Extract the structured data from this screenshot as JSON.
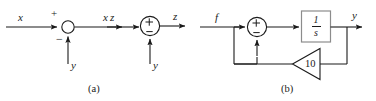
{
  "figure": {
    "captions": [
      {
        "id": "a",
        "text": "(a)"
      },
      {
        "id": "b",
        "text": "(b)"
      }
    ],
    "colors": {
      "line": "#1a1a1a",
      "block_border": "#8c8c8c",
      "background": "#ffffff",
      "text": "#1a1a1a"
    }
  },
  "diagram_a": {
    "variant_1": {
      "input_label": "x",
      "output_label": "z",
      "feedback_input_label": "y",
      "sign_top": "+",
      "sign_bottom": "−",
      "junction_style": "open-circle"
    },
    "variant_2": {
      "input_label": "x",
      "output_label": "z",
      "feedback_input_label": "y",
      "sign_top": "+",
      "sign_bottom": "−",
      "junction_style": "circle-with-internal-signs"
    }
  },
  "diagram_b": {
    "input_label": "f",
    "output_label": "y",
    "sign_top": "+",
    "sign_bottom": "−",
    "integrator_block": {
      "numerator": "1",
      "denominator": "s"
    },
    "gain_block": {
      "value": "10",
      "shape": "triangle-pointing-left"
    }
  }
}
